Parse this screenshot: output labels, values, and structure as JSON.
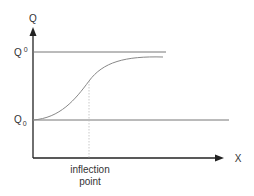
{
  "diagram": {
    "y_axis_label": "Q",
    "x_axis_label": "X",
    "upper_level_label_base": "Q",
    "upper_level_label_sup": "0",
    "lower_level_label_base": "Q",
    "lower_level_label_sub": "0",
    "inflection_label_line1": "inflection",
    "inflection_label_line2": "point",
    "colors": {
      "axis": "#222222",
      "curve": "#888888",
      "level_lines": "#777777",
      "dotted_line": "#bbbbbb",
      "text": "#333333"
    }
  }
}
